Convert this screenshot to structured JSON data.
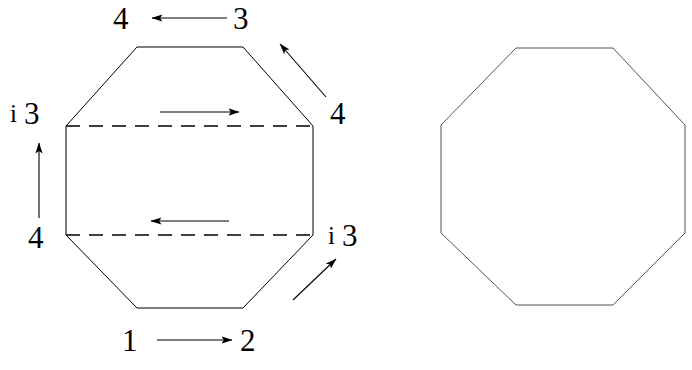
{
  "figure": {
    "background_color": "#ffffff",
    "stroke_color": "#000000",
    "line_width": 1
  },
  "left_octagon": {
    "name": "annotated-octagon",
    "outline": {
      "points": "137,47 243,47 313,126 313,235 243,308 137,308 66,235 66,126",
      "style": "solid"
    },
    "dashed_lines": [
      {
        "name": "upper-dashed-chord",
        "x1": 66,
        "y1": 126,
        "x2": 313,
        "y2": 126
      },
      {
        "name": "lower-dashed-chord",
        "x1": 66,
        "y1": 235,
        "x2": 313,
        "y2": 235
      }
    ],
    "interior_arrows": [
      {
        "name": "upper-interior-arrow",
        "direction": "right",
        "x1": 160,
        "y1": 112,
        "x2": 239,
        "y2": 112
      },
      {
        "name": "lower-interior-arrow",
        "direction": "left",
        "x1": 229,
        "y1": 221,
        "x2": 151,
        "y2": 221
      }
    ],
    "exterior_arrows": [
      {
        "name": "top-arrow",
        "direction": "left",
        "x1": 227,
        "y1": 18,
        "x2": 152,
        "y2": 18
      },
      {
        "name": "bottom-arrow",
        "direction": "right",
        "x1": 157,
        "y1": 340,
        "x2": 232,
        "y2": 340
      },
      {
        "name": "left-arrow",
        "direction": "up",
        "x1": 39,
        "y1": 218,
        "x2": 39,
        "y2": 143
      },
      {
        "name": "upper-right-diagonal-arrow",
        "direction": "up-left",
        "x1": 326,
        "y1": 97,
        "x2": 279,
        "y2": 43
      },
      {
        "name": "lower-right-diagonal-arrow",
        "direction": "up-right",
        "x1": 292,
        "y1": 300,
        "x2": 336,
        "y2": 258
      }
    ]
  },
  "right_octagon": {
    "name": "plain-octagon",
    "outline": {
      "points": "516,48 613,48 685,125 685,233 613,305 516,305 441,233 441,125",
      "style": "solid"
    }
  },
  "labels": {
    "top_left": "4",
    "top_right": "3",
    "upper_left_index": "i",
    "upper_left_number": "3",
    "lower_left_number": "4",
    "upper_right_number": "4",
    "lower_right_index": "i",
    "lower_right_number": "3",
    "bottom_left": "1",
    "bottom_right": "2"
  }
}
